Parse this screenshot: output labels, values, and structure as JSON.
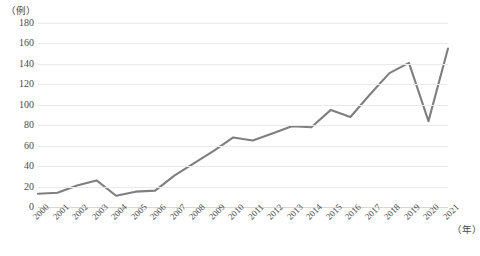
{
  "axis": {
    "y_unit_label": "（例）",
    "x_unit_label": "（年）",
    "y_ticks": [
      180,
      160,
      140,
      120,
      100,
      80,
      60,
      40,
      20,
      0
    ]
  },
  "style": {
    "line_color": "#7f7f7f",
    "grid_color": "#e9e9e9",
    "text_color": "#4a4a4a"
  },
  "chart_data": {
    "type": "line",
    "title": "",
    "xlabel": "（年）",
    "ylabel": "（例）",
    "ylim": [
      0,
      180
    ],
    "ytick_step": 20,
    "grid": true,
    "legend": "none",
    "markers": false,
    "categories": [
      "2000",
      "2001",
      "2002",
      "2003",
      "2004",
      "2005",
      "2006",
      "2007",
      "2008",
      "2009",
      "2010",
      "2011",
      "2012",
      "2013",
      "2014",
      "2015",
      "2016",
      "2017",
      "2018",
      "2019",
      "2020",
      "2021"
    ],
    "values": [
      13,
      14,
      21,
      26,
      11,
      15,
      16,
      31,
      43,
      55,
      68,
      65,
      72,
      79,
      78,
      95,
      88,
      110,
      131,
      141,
      84,
      155
    ]
  }
}
